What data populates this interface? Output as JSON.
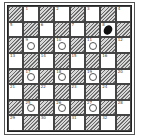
{
  "diagram": {
    "type": "checkers-board",
    "size": 8,
    "playing_squares": "light",
    "colors": {
      "dark_hatch": "#6a6a6a",
      "light": "#ffffff",
      "white_piece_outline": "#555555",
      "black_piece": "#111111"
    },
    "squares": [
      {
        "n": "1",
        "piece": ""
      },
      {
        "n": "2",
        "piece": ""
      },
      {
        "n": "3",
        "piece": ""
      },
      {
        "n": "4",
        "piece": ""
      },
      {
        "n": "5",
        "piece": ""
      },
      {
        "n": "6",
        "piece": ""
      },
      {
        "n": "7",
        "piece": ""
      },
      {
        "n": "8",
        "piece": "black"
      },
      {
        "n": "9",
        "piece": "white"
      },
      {
        "n": "10",
        "piece": "white"
      },
      {
        "n": "11",
        "piece": "white"
      },
      {
        "n": "12",
        "piece": ""
      },
      {
        "n": "13",
        "piece": ""
      },
      {
        "n": "14",
        "piece": ""
      },
      {
        "n": "15",
        "piece": ""
      },
      {
        "n": "16",
        "piece": ""
      },
      {
        "n": "17",
        "piece": "white"
      },
      {
        "n": "18",
        "piece": "white"
      },
      {
        "n": "19",
        "piece": "white"
      },
      {
        "n": "20",
        "piece": ""
      },
      {
        "n": "21",
        "piece": ""
      },
      {
        "n": "22",
        "piece": ""
      },
      {
        "n": "23",
        "piece": ""
      },
      {
        "n": "24",
        "piece": ""
      },
      {
        "n": "25",
        "piece": "white"
      },
      {
        "n": "26",
        "piece": "white"
      },
      {
        "n": "27",
        "piece": "white"
      },
      {
        "n": "28",
        "piece": ""
      },
      {
        "n": "29",
        "piece": ""
      },
      {
        "n": "30",
        "piece": ""
      },
      {
        "n": "31",
        "piece": ""
      },
      {
        "n": "32",
        "piece": ""
      }
    ],
    "pieces": {
      "white": [
        "9",
        "10",
        "11",
        "17",
        "18",
        "19",
        "25",
        "26",
        "27"
      ],
      "black": [
        "8"
      ]
    }
  }
}
